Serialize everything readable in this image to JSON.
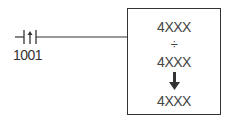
{
  "contact": {
    "address": "1001",
    "type": "positive-transition-contact",
    "symbol": "↑"
  },
  "block": {
    "operation": "divide",
    "operand1": "4XXX",
    "operator_symbol": "÷",
    "operand2": "4XXX",
    "result_arrow": "↓",
    "result": "4XXX"
  },
  "colors": {
    "line": "#333333",
    "background": "#ffffff"
  }
}
